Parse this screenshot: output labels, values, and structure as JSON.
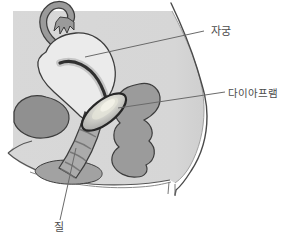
{
  "diagram": {
    "labels": {
      "uterus": {
        "text": "자궁"
      },
      "diaphragm": {
        "text": "다이아프램"
      },
      "vagina": {
        "text": "질"
      }
    },
    "colors": {
      "background": "#ffffff",
      "body_fill": "#d6d6d6",
      "uterus_fill": "#ebebeb",
      "organ_gray": "#979797",
      "outline": "#3d3d3d",
      "leader_line": "#6a6a6a",
      "label_text": "#4d4d4d"
    }
  }
}
